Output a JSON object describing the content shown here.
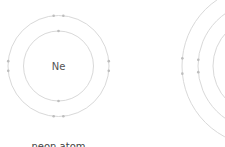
{
  "atoms": [
    {
      "id": "neon",
      "symbol": "Ne",
      "caption": "neon atom",
      "shells": [
        {
          "electrons": 2
        },
        {
          "electrons": 8
        }
      ]
    },
    {
      "id": "second-atom",
      "symbol": "",
      "caption": "",
      "shells": [
        {
          "electrons": 2
        },
        {
          "electrons": 8
        },
        {
          "electrons": 8
        }
      ]
    }
  ],
  "colors": {
    "shell": "#d9d9d9",
    "electron": "#bdbdbd",
    "text": "#555555"
  }
}
